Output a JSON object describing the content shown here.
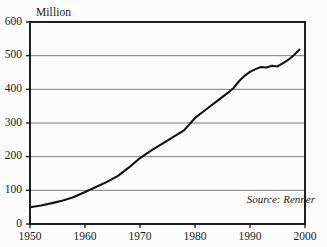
{
  "chart_data": {
    "type": "line",
    "title": "",
    "subtitle": "",
    "ylabel": "Million",
    "xlabel": "",
    "xlim": [
      1950,
      2000
    ],
    "ylim": [
      0,
      600
    ],
    "grid": true,
    "legend": false,
    "annotations": [
      {
        "name": "source",
        "text": "Source: Renner"
      }
    ],
    "ytick_labels": [
      "600",
      "500",
      "400",
      "300",
      "200",
      "100",
      "0"
    ],
    "ytick_values": [
      600,
      500,
      400,
      300,
      200,
      100,
      0
    ],
    "xtick_labels": [
      "1950",
      "1960",
      "1970",
      "1980",
      "1990",
      "2000"
    ],
    "xtick_values": [
      1950,
      1960,
      1970,
      1980,
      1990,
      2000
    ],
    "series": [
      {
        "name": "Million",
        "color": "#111111",
        "x": [
          1950,
          1952,
          1954,
          1956,
          1958,
          1960,
          1962,
          1964,
          1966,
          1968,
          1970,
          1972,
          1974,
          1976,
          1978,
          1980,
          1982,
          1984,
          1986,
          1987,
          1988,
          1989,
          1990,
          1991,
          1992,
          1993,
          1994,
          1995,
          1996,
          1997,
          1998,
          1999
        ],
        "values": [
          50,
          55,
          62,
          70,
          80,
          95,
          110,
          125,
          143,
          168,
          196,
          218,
          238,
          258,
          278,
          315,
          340,
          365,
          390,
          404,
          424,
          440,
          452,
          460,
          466,
          465,
          470,
          468,
          478,
          488,
          502,
          518
        ]
      }
    ]
  },
  "colors": {
    "background": "#fcfcfc",
    "frame": "#141414",
    "gridline": "#6e6e6e",
    "line": "#111111",
    "text": "#1a1a1a"
  }
}
